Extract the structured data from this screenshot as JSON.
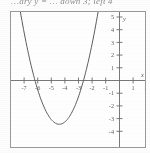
{
  "header": {
    "text": "…ary y = … down 3; left 4"
  },
  "chart_data": {
    "type": "line",
    "title": "",
    "subtitle": "",
    "xlabel": "x",
    "ylabel": "y",
    "xlim": [
      -7.6,
      2.4
    ],
    "ylim": [
      -4.7,
      5.4
    ],
    "xticks": [
      -7,
      -6,
      -5,
      -4,
      -3,
      -2,
      -1,
      1,
      2
    ],
    "yticks": [
      5,
      4,
      3,
      2,
      1,
      -1,
      -2,
      -3,
      -4
    ],
    "xtick_labels": [
      "-7",
      "-6",
      "-5",
      "-4",
      "-3",
      "-2",
      "-1",
      "1",
      "2"
    ],
    "ytick_labels": [
      "5",
      "4",
      "3",
      "2",
      "1",
      "-1",
      "-2",
      "-3",
      "-4"
    ],
    "grid": false,
    "legend": null,
    "axis_label_x": "x",
    "axis_label_y": "y",
    "series": [
      {
        "name": "parabola",
        "equation": "y = (x + 4)^2 - 3",
        "vertex": [
          -4,
          -3
        ],
        "x_intercepts": [
          -6.73,
          -2.27
        ],
        "color": "#5d5d5d",
        "x": [
          -6.9,
          -6.6,
          -6.3,
          -6.0,
          -5.7,
          -5.4,
          -5.1,
          -4.8,
          -4.5,
          -4.2,
          -4.0,
          -3.8,
          -3.5,
          -3.2,
          -2.9,
          -2.6,
          -2.3,
          -2.0,
          -1.7,
          -1.4,
          -1.1
        ],
        "y": [
          5.41,
          3.76,
          2.29,
          1.0,
          -0.11,
          -1.04,
          -1.79,
          -2.36,
          -2.75,
          -2.96,
          -3.0,
          -2.96,
          -2.75,
          -2.36,
          -1.79,
          -1.04,
          -0.11,
          1.0,
          2.29,
          3.76,
          5.41
        ]
      }
    ]
  }
}
